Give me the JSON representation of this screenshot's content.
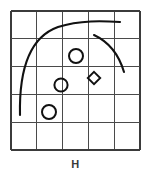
{
  "figure": {
    "caption": "H",
    "label": "H",
    "background_color": "#ffffff",
    "ink_color": "#111111",
    "grid_color": "#4a4a4a"
  },
  "chart_data": {
    "type": "scatter",
    "title": "H",
    "xlabel": "",
    "ylabel": "",
    "xlim": [
      0,
      5
    ],
    "ylim": [
      0,
      5
    ],
    "grid": true,
    "legend": "none",
    "grid_spec": {
      "columns": 5,
      "rows": 5,
      "x_ticks": [
        0,
        1,
        2,
        3,
        4,
        5
      ],
      "y_ticks": [
        0,
        1,
        2,
        3,
        4,
        5
      ],
      "cell_width_px": 25.8,
      "cell_height_px": 27.8,
      "plot_box_px": {
        "left": 11,
        "top": 11,
        "right": 140,
        "bottom": 150
      }
    },
    "series": [
      {
        "name": "circles",
        "marker": "circle",
        "points": [
          {
            "x": 2.52,
            "y": 3.38,
            "px": 76,
            "py": 56,
            "r_px": 7.0
          },
          {
            "x": 1.94,
            "y": 2.34,
            "px": 61,
            "py": 85,
            "r_px": 6.6
          },
          {
            "x": 1.47,
            "y": 1.37,
            "px": 49,
            "py": 112,
            "r_px": 7.0
          }
        ]
      },
      {
        "name": "diamond",
        "marker": "diamond",
        "points": [
          {
            "x": 3.22,
            "y": 2.59,
            "px": 94,
            "py": 78,
            "r_px": 6.2
          }
        ]
      }
    ],
    "curves": [
      {
        "name": "outer-arc",
        "description": "large arc sweeping from lower-left up to upper-right plateau",
        "path_px": "M 20,115 C 19,70 30,37 58,27 C 80,20 103,21 120,22"
      },
      {
        "name": "inner-arc",
        "description": "short arc in upper-right curving down to the right",
        "path_px": "M 94,35 C 109,42 119,55 124,72"
      }
    ]
  }
}
